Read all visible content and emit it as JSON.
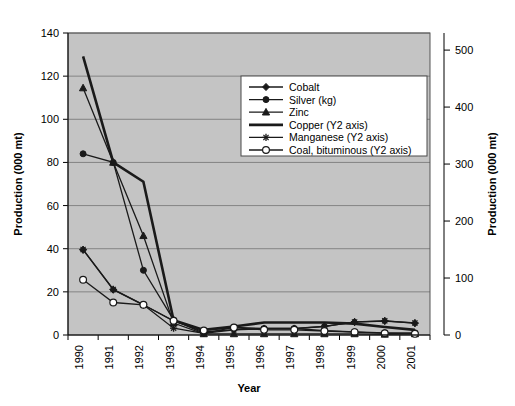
{
  "chart_data": {
    "type": "line",
    "title": "",
    "xlabel": "Year",
    "ylabel": "Production (000 mt)",
    "y2label": "Production (000 mt)",
    "categories": [
      "1990",
      "1991",
      "1992",
      "1993",
      "1994",
      "1995",
      "1996",
      "1997",
      "1998",
      "1999",
      "2000",
      "2001"
    ],
    "ylim": [
      0,
      140
    ],
    "yticks": [
      0,
      20,
      40,
      60,
      80,
      100,
      120,
      140
    ],
    "y2lim": [
      0,
      530
    ],
    "y2ticks": [
      0,
      100,
      200,
      300,
      400,
      500
    ],
    "grid": true,
    "legend_position": "upper-center-right",
    "series": [
      {
        "name": "Cobalt",
        "axis": "y1",
        "marker": "diamond",
        "values": [
          39.5,
          21.0,
          14.0,
          6.5,
          1.5,
          2.5,
          3.0,
          3.0,
          4.0,
          6.0,
          6.5,
          5.5
        ]
      },
      {
        "name": "Silver (kg)",
        "axis": "y1",
        "marker": "circle",
        "values": [
          84.0,
          80.0,
          30.0,
          7.0,
          0.8,
          3.5,
          3.0,
          3.0,
          2.0,
          1.5,
          1.0,
          1.0
        ]
      },
      {
        "name": "Zinc",
        "axis": "y1",
        "marker": "triangle",
        "values": [
          114.5,
          80.0,
          46.0,
          5.5,
          0.5,
          0.5,
          0.5,
          0.5,
          0.5,
          0.5,
          0.3,
          0.5
        ]
      },
      {
        "name": "Copper (Y2 axis)",
        "axis": "y2",
        "marker": "none",
        "values": [
          489,
          303,
          269,
          26,
          9,
          15,
          22,
          22,
          22,
          20,
          14,
          9
        ]
      },
      {
        "name": "Manganese (Y2 axis)",
        "axis": "y2",
        "marker": "star",
        "values": [
          150,
          80,
          53,
          12,
          3,
          9,
          11,
          11,
          15,
          23,
          25,
          21
        ]
      },
      {
        "name": "Coal, bituminous (Y2 axis)",
        "axis": "y2",
        "marker": "open-circle",
        "values": [
          97,
          57,
          53,
          25,
          8,
          13,
          9,
          9,
          7,
          5,
          3,
          2
        ]
      }
    ]
  },
  "axes": {
    "y_left_title": "Production (000 mt)",
    "y_right_title": "Production (000 mt)",
    "x_title": "Year"
  },
  "legend": {
    "items": [
      {
        "label": "Cobalt",
        "marker": "diamond-icon"
      },
      {
        "label": "Silver (kg)",
        "marker": "circle-icon"
      },
      {
        "label": "Zinc",
        "marker": "triangle-icon"
      },
      {
        "label": "Copper (Y2 axis)",
        "marker": "thick-line-icon"
      },
      {
        "label": "Manganese (Y2 axis)",
        "marker": "star-icon"
      },
      {
        "label": "Coal, bituminous (Y2 axis)",
        "marker": "open-circle-icon"
      }
    ]
  },
  "colors": {
    "plot_background": "#c4c4c4",
    "gridline": "#7d7d7d",
    "series_stroke": "#1a1a1a",
    "legend_background": "#ffffff"
  }
}
